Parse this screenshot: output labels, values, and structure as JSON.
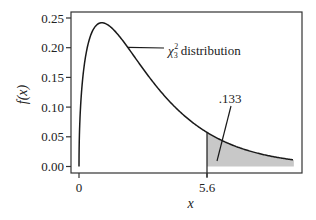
{
  "chart_data": {
    "type": "line",
    "title": "",
    "xlabel": "x",
    "ylabel": "f(x)",
    "series": [
      {
        "name": "chi-square distribution, 3 degrees of freedom",
        "function": "chi2_pdf_df3",
        "x_range": [
          0,
          9.4
        ]
      }
    ],
    "x_ticks": [
      {
        "value": 0,
        "label": "0"
      },
      {
        "value": 5.6,
        "label": "5.6"
      }
    ],
    "y_ticks": [
      {
        "value": 0.0,
        "label": "0.00"
      },
      {
        "value": 0.05,
        "label": "0.05"
      },
      {
        "value": 0.1,
        "label": "0.10"
      },
      {
        "value": 0.15,
        "label": "0.15"
      },
      {
        "value": 0.2,
        "label": "0.20"
      },
      {
        "value": 0.25,
        "label": "0.25"
      }
    ],
    "xlim": [
      -0.3,
      9.8
    ],
    "ylim": [
      -0.012,
      0.262
    ],
    "shaded_region": {
      "from": 5.6,
      "to": 9.4,
      "color": "#c8c8c8",
      "area_label": ".133"
    },
    "annotations": [
      {
        "text": "distribution",
        "symbol": "χ",
        "superscript": "2",
        "subscript": "3",
        "points_to_x": 2.1
      },
      {
        "text": ".133",
        "points_to_x": 6.1
      }
    ],
    "grid": false,
    "legend": "none"
  },
  "labels": {
    "ylabel": "f(x)",
    "xlabel": "x",
    "dist_symbol": "χ",
    "dist_sup": "2",
    "dist_sub": "3",
    "dist_text": "distribution",
    "area_value": ".133"
  },
  "colors": {
    "curve": "#1a1a1a",
    "shade": "#c8c8c8",
    "frame": "#333333"
  }
}
